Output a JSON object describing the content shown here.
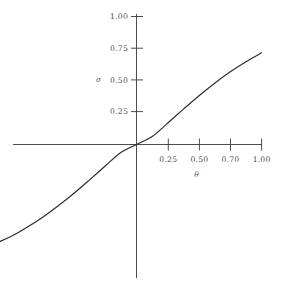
{
  "figure": {
    "background_color": "#ffffff",
    "curve_color": "#2b2b2b",
    "axis_color": "#3a3a3a",
    "text_color": "#4a4a4a"
  },
  "chart_data": {
    "type": "line",
    "title": "",
    "subtitle": "",
    "xlabel": "θ",
    "ylabel": "σ",
    "xlim": [
      -4.0,
      1.0
    ],
    "ylim": [
      -1.0,
      1.05
    ],
    "grid": false,
    "legend": false,
    "legend_position": "none",
    "xticks": [
      0.25,
      0.5,
      0.7,
      1.0
    ],
    "xticklabels": [
      "0.25",
      "0.50",
      "0.70",
      "1.00"
    ],
    "yticks": [
      0.25,
      0.5,
      0.75,
      1.0
    ],
    "yticklabels": [
      "0.25",
      "0.50",
      "0.75",
      "1.00"
    ],
    "axes_cross_at_origin": true,
    "series": [
      {
        "name": "sigmoid",
        "x": [
          -4.0,
          -3.75,
          -3.5,
          -3.25,
          -3.0,
          -2.75,
          -2.5,
          -2.25,
          -2.0,
          -1.75,
          -1.5,
          -1.25,
          -1.0,
          -0.875,
          -0.75,
          -0.625,
          -0.5,
          -0.375,
          -0.25,
          -0.125,
          0.0,
          0.125,
          0.25,
          0.375,
          0.5,
          0.625,
          0.75,
          0.875,
          1.0
        ],
        "y": [
          -1.0,
          -0.999,
          -0.999,
          -0.998,
          -0.996,
          -0.993,
          -0.988,
          -0.979,
          -0.964,
          -0.938,
          -0.894,
          -0.823,
          -0.716,
          -0.647,
          -0.568,
          -0.479,
          -0.381,
          -0.276,
          -0.168,
          -0.062,
          0.0,
          0.062,
          0.168,
          0.276,
          0.381,
          0.479,
          0.568,
          0.647,
          0.716
        ]
      }
    ]
  },
  "labels": {
    "ylabel_glyph": "σ",
    "xlabel_glyph": "θ",
    "y1": "1.00",
    "y2": "0.75",
    "y3": "0.50",
    "y4": "0.25",
    "x1": "0.25",
    "x2": "0.50",
    "x3": "0.70",
    "x4": "1.00"
  }
}
